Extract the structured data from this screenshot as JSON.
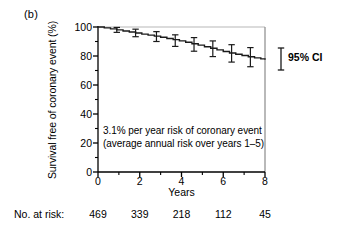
{
  "figure": {
    "panel_label": "(b)",
    "annotation_line1": "3.1% per year risk of coronary event",
    "annotation_line2": "(average annual risk over years 1–5)",
    "ci_legend_label": "95% CI",
    "risk_row_title": "No. at risk:",
    "risk_values": [
      "469",
      "339",
      "218",
      "112",
      "45"
    ],
    "axis_color": "#000000",
    "curve_color": "#1a1a1a"
  },
  "chart_data": {
    "type": "line",
    "title": "",
    "subtitle": "",
    "xlabel": "Years",
    "ylabel": "Survival free of coronary event (%)",
    "xlim": [
      0,
      8
    ],
    "ylim": [
      0,
      100
    ],
    "grid": false,
    "legend_position": "right-outside",
    "xticks": [
      0,
      2,
      4,
      6,
      8
    ],
    "xtick_labels": [
      "0",
      "2",
      "4",
      "6",
      "8"
    ],
    "xminor_ticks": [
      1,
      3,
      5,
      7
    ],
    "yticks": [
      0,
      20,
      40,
      60,
      80,
      100
    ],
    "ytick_labels": [
      "0",
      "20",
      "40",
      "60",
      "80",
      "100"
    ],
    "yminor_ticks": [
      10,
      30,
      50,
      70,
      90
    ],
    "series": [
      {
        "name": "Survival free of coronary event",
        "x": [
          0,
          0.3,
          0.6,
          0.9,
          1.2,
          1.5,
          1.8,
          2.1,
          2.4,
          2.7,
          3.0,
          3.3,
          3.6,
          3.9,
          4.2,
          4.5,
          4.8,
          5.1,
          5.4,
          5.7,
          6.0,
          6.3,
          6.6,
          6.9,
          7.2,
          7.5,
          7.8,
          8.0
        ],
        "values": [
          100.0,
          99.4,
          98.7,
          98.0,
          97.2,
          96.6,
          95.9,
          95.1,
          94.4,
          93.7,
          92.9,
          92.1,
          91.3,
          90.4,
          89.5,
          88.5,
          87.5,
          86.4,
          85.3,
          84.2,
          83.1,
          82.1,
          81.2,
          80.3,
          79.5,
          78.7,
          78.0,
          77.5
        ]
      }
    ],
    "error_bars": {
      "label": "95% CI",
      "x": [
        0.9,
        1.8,
        2.8,
        3.7,
        4.6,
        5.5,
        6.4,
        7.3
      ],
      "y": [
        98.0,
        95.9,
        93.4,
        90.6,
        88.0,
        85.0,
        81.8,
        79.2
      ],
      "lower": [
        96.3,
        93.3,
        90.0,
        86.6,
        83.3,
        79.6,
        75.8,
        72.6
      ],
      "upper": [
        99.7,
        98.5,
        96.8,
        94.6,
        92.7,
        90.4,
        87.8,
        85.8
      ]
    },
    "annotations": [
      {
        "text": "3.1% per year risk of coronary event",
        "x": 0.3,
        "y": 23
      },
      {
        "text": "(average annual risk over years 1–5)",
        "x": 0.3,
        "y": 16
      }
    ],
    "numbers_at_risk": {
      "label": "No. at risk:",
      "x": [
        0,
        2,
        4,
        6,
        8
      ],
      "values": [
        469,
        339,
        218,
        112,
        45
      ]
    }
  }
}
